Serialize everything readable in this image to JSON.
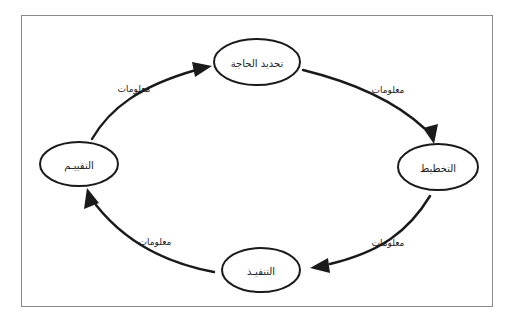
{
  "diagram": {
    "type": "cycle-diagram",
    "direction": "clockwise",
    "language": "ar",
    "frame": {
      "border_color": "#8a8a8a",
      "background": "#ffffff"
    },
    "stroke_color": "#1a1a1a",
    "nodes": [
      {
        "id": "need",
        "label": "تحديد الحاجة",
        "position": "top"
      },
      {
        "id": "planning",
        "label": "التخطيط",
        "position": "right"
      },
      {
        "id": "implementation",
        "label": "التنفيـذ",
        "position": "bottom"
      },
      {
        "id": "evaluation",
        "label": "التقييـم",
        "position": "left"
      }
    ],
    "edges": [
      {
        "id": "need-to-planning",
        "label": "معلومات",
        "from": "need",
        "to": "planning",
        "arrow": "down-right"
      },
      {
        "id": "planning-to-implementation",
        "label": "معلومات",
        "from": "planning",
        "to": "implementation",
        "arrow": "left-down"
      },
      {
        "id": "implementation-to-evaluation",
        "label": "معلومات",
        "from": "implementation",
        "to": "evaluation",
        "arrow": "up-left"
      },
      {
        "id": "evaluation-to-need",
        "label": "معلومات",
        "from": "evaluation",
        "to": "need",
        "arrow": "right-up"
      }
    ]
  }
}
